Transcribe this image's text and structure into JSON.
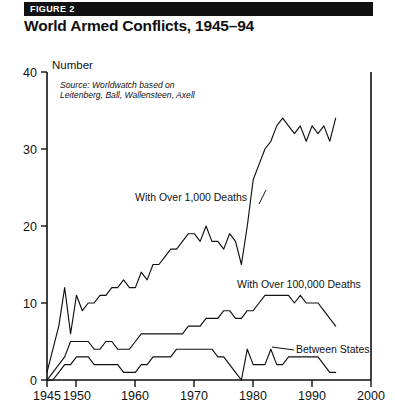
{
  "figure": {
    "label": "FIGURE 2",
    "title": "World Armed Conflicts, 1945–94"
  },
  "source_note": {
    "line1": "Source: Worldwatch based on",
    "line2": "Leitenberg, Ball, Wallensteen, Axell"
  },
  "colors": {
    "ink": "#111111",
    "paper": "#ffffff",
    "header_bar": "#111111",
    "header_text": "#ffffff"
  },
  "chart_data": {
    "type": "line",
    "title": "World Armed Conflicts, 1945–94",
    "xlabel": "",
    "ylabel": "Number",
    "xlim": [
      1945,
      2000
    ],
    "ylim": [
      0,
      40
    ],
    "yticks": [
      0,
      10,
      20,
      30,
      40
    ],
    "xticks": [
      1945,
      1950,
      1960,
      1970,
      1980,
      1990,
      2000
    ],
    "grid": false,
    "legend": "inline-annotations",
    "x": [
      1945,
      1946,
      1947,
      1948,
      1949,
      1950,
      1951,
      1952,
      1953,
      1954,
      1955,
      1956,
      1957,
      1958,
      1959,
      1960,
      1961,
      1962,
      1963,
      1964,
      1965,
      1966,
      1967,
      1968,
      1969,
      1970,
      1971,
      1972,
      1973,
      1974,
      1975,
      1976,
      1977,
      1978,
      1979,
      1980,
      1981,
      1982,
      1983,
      1984,
      1985,
      1986,
      1987,
      1988,
      1989,
      1990,
      1991,
      1992,
      1993,
      1994
    ],
    "series": [
      {
        "name": "With Over 1,000 Deaths",
        "label": "With Over 1,000 Deaths",
        "values": [
          1,
          4,
          7,
          12,
          6,
          11,
          9,
          10,
          10,
          11,
          11,
          12,
          12,
          13,
          12,
          12,
          14,
          13,
          15,
          15,
          16,
          17,
          17,
          18,
          19,
          19,
          18,
          20,
          18,
          18,
          17,
          19,
          18,
          15,
          20,
          26,
          28,
          30,
          31,
          33,
          34,
          33,
          32,
          33,
          31,
          33,
          32,
          33,
          31,
          34
        ]
      },
      {
        "name": "With Over 100,000 Deaths",
        "label": "With Over 100,000 Deaths",
        "values": [
          0,
          1,
          2,
          3,
          5,
          5,
          5,
          5,
          4,
          4,
          5,
          5,
          4,
          4,
          4,
          5,
          6,
          6,
          6,
          6,
          6,
          6,
          6,
          6,
          7,
          7,
          7,
          8,
          8,
          8,
          9,
          9,
          8,
          8,
          9,
          9,
          10,
          11,
          11,
          11,
          11,
          11,
          10,
          11,
          10,
          10,
          10,
          9,
          8,
          7
        ]
      },
      {
        "name": "Between States",
        "label": "Between States",
        "values": [
          0,
          0,
          1,
          2,
          2,
          3,
          3,
          3,
          2,
          2,
          2,
          2,
          2,
          1,
          1,
          1,
          2,
          2,
          3,
          3,
          3,
          3,
          4,
          4,
          4,
          4,
          4,
          4,
          4,
          3,
          3,
          2,
          1,
          0,
          4,
          2,
          2,
          2,
          4,
          2,
          2,
          3,
          3,
          3,
          3,
          3,
          3,
          2,
          1,
          1
        ]
      }
    ]
  }
}
